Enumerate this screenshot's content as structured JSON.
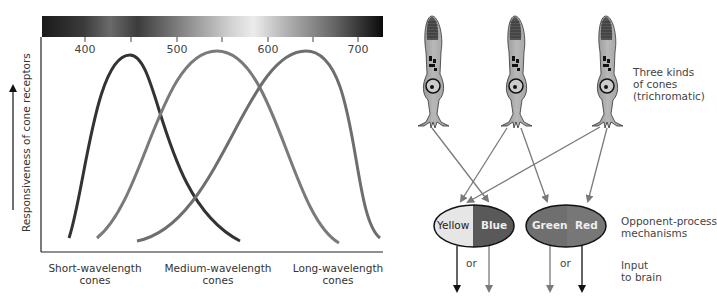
{
  "spectrum": {
    "name": "visible-spectrum-bar",
    "tick_labels": [
      "400",
      "500",
      "600",
      "700"
    ],
    "unlabeled_ticks": [
      "450",
      "550",
      "650"
    ]
  },
  "chart": {
    "ylabel": "Responsiveness of cone receptors",
    "curves": [
      {
        "name": "Short-wavelength cones",
        "line1": "Short-wavelength",
        "line2": "cones",
        "peak_nm": 450,
        "color": "#333333"
      },
      {
        "name": "Medium-wavelength cones",
        "line1": "Medium-wavelength",
        "line2": "cones",
        "peak_nm": 550,
        "color": "#7a7a7a"
      },
      {
        "name": "Long-wavelength cones",
        "line1": "Long-wavelength",
        "line2": "cones",
        "peak_nm": 650,
        "color": "#6e6e6e"
      }
    ]
  },
  "diagram": {
    "cones_label": [
      "Three kinds",
      "of cones",
      "(trichromatic)"
    ],
    "opponent_label": [
      "Opponent-process",
      "mechanisms"
    ],
    "input_label": [
      "Input",
      "to brain"
    ],
    "mechanisms": [
      {
        "left": "Yellow",
        "right": "Blue",
        "left_color": "#e6e6e6",
        "right_color": "#595959"
      },
      {
        "left": "Green",
        "right": "Red",
        "left_color": "#6f6f6f",
        "right_color": "#767676"
      }
    ],
    "or_label": "or"
  }
}
